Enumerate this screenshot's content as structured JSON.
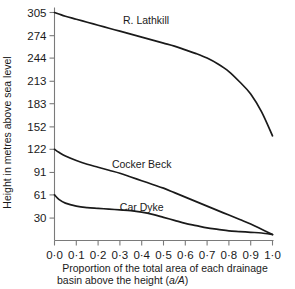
{
  "chart_data": {
    "type": "line",
    "title": "",
    "xlabel": "Proportion of the total area of each drainage basin above the height (a/A)",
    "xlabel_line1": "Proportion of the total area of each drainage",
    "xlabel_line2": "basin above the height (",
    "xlabel_italic": "a/A",
    "xlabel_line2_end": ")",
    "ylabel": "Height in metres above sea level",
    "xlim": [
      0.0,
      1.0
    ],
    "ylim": [
      0,
      305
    ],
    "grid": false,
    "legend": "inline-labels",
    "xticks": [
      0.0,
      0.1,
      0.2,
      0.3,
      0.4,
      0.5,
      0.6,
      0.7,
      0.8,
      0.9,
      1.0
    ],
    "xticklabels": [
      "0·0",
      "0·1",
      "0·2",
      "0·3",
      "0·4",
      "0·5",
      "0·6",
      "0·7",
      "0·8",
      "0·9",
      "1·0"
    ],
    "yticks": [
      30,
      61,
      91,
      122,
      152,
      183,
      213,
      244,
      274,
      305
    ],
    "yticklabels": [
      "30",
      "61",
      "91",
      "122",
      "152",
      "183",
      "213",
      "244",
      "274",
      "305"
    ],
    "series": [
      {
        "name": "R. Lathkill",
        "label": "R. Lathkill",
        "label_x": 0.42,
        "label_y": 290,
        "x": [
          0.0,
          0.02,
          0.05,
          0.1,
          0.15,
          0.2,
          0.25,
          0.3,
          0.35,
          0.4,
          0.45,
          0.5,
          0.55,
          0.6,
          0.65,
          0.7,
          0.75,
          0.8,
          0.85,
          0.9,
          0.95,
          1.0
        ],
        "values": [
          305,
          303,
          300,
          296,
          292,
          288,
          284,
          280,
          276,
          272,
          268,
          264,
          260,
          255,
          250,
          244,
          236,
          226,
          212,
          196,
          172,
          140
        ]
      },
      {
        "name": "Cocker Beck",
        "label": "Cocker Beck",
        "label_x": 0.4,
        "label_y": 97,
        "x": [
          0.0,
          0.02,
          0.05,
          0.1,
          0.15,
          0.2,
          0.25,
          0.3,
          0.35,
          0.4,
          0.45,
          0.5,
          0.55,
          0.6,
          0.65,
          0.7,
          0.75,
          0.8,
          0.85,
          0.9,
          0.95,
          1.0
        ],
        "values": [
          122,
          118,
          113,
          107,
          102,
          98,
          94,
          90,
          85,
          80,
          75,
          70,
          64,
          58,
          52,
          46,
          40,
          34,
          28,
          22,
          15,
          8
        ]
      },
      {
        "name": "Car Dyke",
        "label": "Car Dyke",
        "label_x": 0.4,
        "label_y": 40,
        "x": [
          0.0,
          0.02,
          0.05,
          0.1,
          0.15,
          0.2,
          0.25,
          0.3,
          0.35,
          0.4,
          0.45,
          0.5,
          0.55,
          0.6,
          0.65,
          0.7,
          0.75,
          0.8,
          0.85,
          0.9,
          0.95,
          1.0
        ],
        "values": [
          61,
          55,
          50,
          46,
          44,
          43,
          42,
          41,
          40,
          38,
          35,
          31,
          27,
          23,
          20,
          17,
          15,
          13,
          12,
          11,
          10,
          8
        ]
      }
    ]
  }
}
